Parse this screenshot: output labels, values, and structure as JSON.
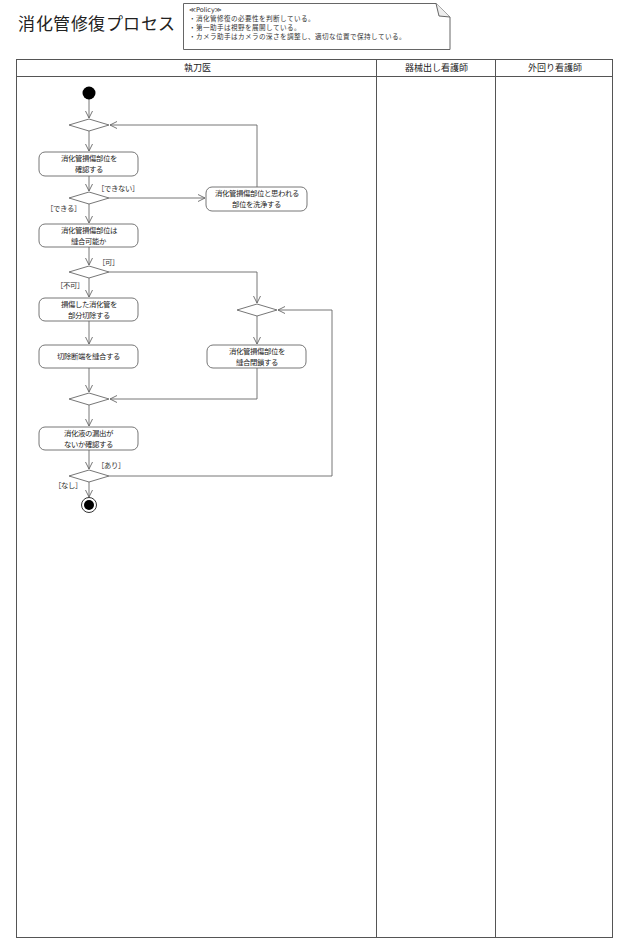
{
  "title": "消化管修復プロセス",
  "note": {
    "stereotype": "≪Policy≫",
    "lines": [
      "・消化管修復の必要性を判断している。",
      "・第一助手は視野を展開している。",
      "・カメラ助手はカメラの深さを調整し、適切な位置で保持している。"
    ]
  },
  "lanes": [
    {
      "label": "執刀医"
    },
    {
      "label": "器械出し看護師"
    },
    {
      "label": "外回り看護師"
    }
  ],
  "actions": [
    {
      "id": "confirm-damage",
      "label": "消化管損傷部位を\n確認する"
    },
    {
      "id": "wash-site",
      "label": "消化管損傷部位と思われる\n部位を洗浄する"
    },
    {
      "id": "suturable-check",
      "label": "消化管損傷部位は\n縫合可能か"
    },
    {
      "id": "partial-resection",
      "label": "損傷した消化管を\n部分切除する"
    },
    {
      "id": "suture-stump",
      "label": "切除断端を縫合する"
    },
    {
      "id": "suture-close",
      "label": "消化管損傷部位を\n縫合閉鎖する"
    },
    {
      "id": "leak-check",
      "label": "消化液の漏出が\nないか確認する"
    }
  ],
  "guards": {
    "cannot": "［できない］",
    "can": "［できる］",
    "possible": "［可］",
    "not_possible": "［不可］",
    "yes_leak": "［あり］",
    "no_leak": "［なし］"
  },
  "colors": {
    "line": "#666666",
    "border": "#555555",
    "node_fill": "#ffffff",
    "initial": "#000000"
  }
}
